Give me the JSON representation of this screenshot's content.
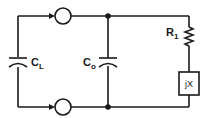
{
  "diagram": {
    "type": "circuit-schematic",
    "components": {
      "load_capacitor": {
        "label": "C",
        "subscript": "L"
      },
      "shunt_capacitor": {
        "label": "C",
        "subscript": "o"
      },
      "series_resistor": {
        "label": "R",
        "subscript": "1"
      },
      "reactance_box": {
        "label": "jX"
      },
      "top_terminal": {
        "label": ""
      },
      "bottom_terminal": {
        "label": ""
      }
    },
    "colors": {
      "line": "#1a1a1a",
      "background": "#ffffff"
    }
  }
}
